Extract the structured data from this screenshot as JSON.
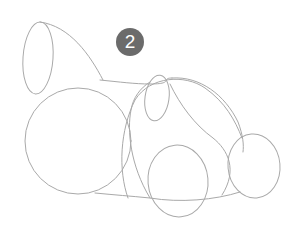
{
  "step": {
    "number": "2",
    "badge_color": "#6b6b6b",
    "text_color": "#ffffff"
  },
  "illustration": {
    "subject": "bunny pencil sketch (construction shapes)",
    "stroke_color": "#a9a9a9",
    "shapes": [
      {
        "name": "ear",
        "type": "ellipse"
      },
      {
        "name": "ear-back-curve",
        "type": "curve"
      },
      {
        "name": "head",
        "type": "circle"
      },
      {
        "name": "body",
        "type": "curve"
      },
      {
        "name": "cheek",
        "type": "ellipse"
      },
      {
        "name": "front-paw",
        "type": "ellipse"
      },
      {
        "name": "back-paw",
        "type": "ellipse"
      },
      {
        "name": "belly-line",
        "type": "curve"
      }
    ]
  }
}
